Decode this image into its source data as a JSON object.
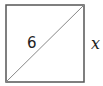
{
  "diagram": {
    "shape": "square",
    "diagonal_label": "6",
    "side_label": "x",
    "colors": {
      "stroke": "#555555",
      "diagonal": "#888888",
      "text": "#222222"
    }
  }
}
